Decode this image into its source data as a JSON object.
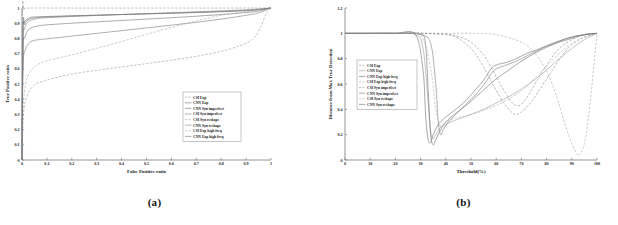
{
  "figure": {
    "subfigures": [
      {
        "caption": "(a)"
      },
      {
        "caption": "(b)"
      }
    ]
  },
  "chart_data": [
    {
      "type": "line",
      "title": "",
      "caption": "(a)",
      "xlabel": "False Positive ratio",
      "ylabel": "True Positive ratio",
      "xlim": [
        0,
        1
      ],
      "ylim": [
        0,
        1
      ],
      "xticks": [
        "0",
        "0.1",
        "0.2",
        "0.3",
        "0.4",
        "0.5",
        "0.6",
        "0.7",
        "0.8",
        "0.9",
        "1"
      ],
      "yticks": [
        "0",
        "0.1",
        "0.2",
        "0.3",
        "0.4",
        "0.5",
        "0.6",
        "0.7",
        "0.8",
        "0.9",
        "1"
      ],
      "grid": false,
      "legend_position": "lower-right",
      "series": [
        {
          "name": "CSI Exp",
          "style": "dashed",
          "color": "#8d8d8d",
          "x": [
            0,
            0.002,
            0.006,
            0.012,
            0.02,
            0.05,
            0.1,
            0.2,
            0.3,
            0.4,
            0.5,
            0.6,
            0.7,
            0.8,
            0.9,
            0.95,
            1
          ],
          "y": [
            0,
            0.97,
            0.992,
            0.997,
            0.999,
            1,
            1,
            1,
            1,
            1,
            1,
            1,
            1,
            1,
            1,
            1,
            1
          ]
        },
        {
          "name": "CNN Exp",
          "style": "solid",
          "color": "#6f6f6f",
          "x": [
            0,
            0.004,
            0.01,
            0.02,
            0.035,
            0.05,
            0.1,
            0.2,
            0.3,
            0.4,
            0.5,
            0.6,
            0.7,
            0.8,
            0.9,
            0.95,
            1
          ],
          "y": [
            0,
            0.86,
            0.905,
            0.925,
            0.938,
            0.941,
            0.944,
            0.949,
            0.953,
            0.957,
            0.961,
            0.965,
            0.97,
            0.975,
            0.982,
            0.988,
            1
          ]
        },
        {
          "name": "CNN Syn imperfect",
          "style": "solid",
          "color": "#777777",
          "x": [
            0,
            0.004,
            0.012,
            0.025,
            0.04,
            0.06,
            0.1,
            0.2,
            0.3,
            0.4,
            0.5,
            0.6,
            0.7,
            0.8,
            0.9,
            0.95,
            1
          ],
          "y": [
            0,
            0.71,
            0.81,
            0.855,
            0.872,
            0.881,
            0.889,
            0.9,
            0.909,
            0.918,
            0.927,
            0.936,
            0.946,
            0.957,
            0.97,
            0.98,
            1
          ]
        },
        {
          "name": "CSI Syn imperfect",
          "style": "solid",
          "color": "#7d7d7d",
          "x": [
            0,
            0.004,
            0.012,
            0.03,
            0.05,
            0.07,
            0.1,
            0.2,
            0.3,
            0.4,
            0.5,
            0.6,
            0.7,
            0.8,
            0.9,
            0.95,
            1
          ],
          "y": [
            0,
            0.6,
            0.72,
            0.772,
            0.787,
            0.792,
            0.797,
            0.815,
            0.833,
            0.851,
            0.869,
            0.887,
            0.906,
            0.927,
            0.952,
            0.968,
            1
          ]
        },
        {
          "name": "CSI Syn reshape",
          "style": "dashed",
          "color": "#a5a5a5",
          "x": [
            0,
            0.005,
            0.015,
            0.03,
            0.06,
            0.1,
            0.15,
            0.2,
            0.3,
            0.4,
            0.5,
            0.6,
            0.7,
            0.8,
            0.88,
            0.93,
            0.96,
            1
          ],
          "y": [
            0,
            0.35,
            0.5,
            0.575,
            0.625,
            0.652,
            0.672,
            0.692,
            0.735,
            0.78,
            0.827,
            0.872,
            0.915,
            0.952,
            0.972,
            0.982,
            0.988,
            1
          ]
        },
        {
          "name": "CNN Syn reshape",
          "style": "solid",
          "color": "#8a8a8a",
          "x": [
            0,
            0.004,
            0.01,
            0.02,
            0.04,
            0.07,
            0.1,
            0.2,
            0.3,
            0.4,
            0.5,
            0.6,
            0.7,
            0.8,
            0.9,
            0.95,
            1
          ],
          "y": [
            0,
            0.78,
            0.86,
            0.9,
            0.922,
            0.932,
            0.936,
            0.944,
            0.951,
            0.957,
            0.963,
            0.969,
            0.975,
            0.981,
            0.988,
            0.993,
            1
          ]
        },
        {
          "name": "CSI Exp high freq",
          "style": "dashed",
          "color": "#9a9a9a",
          "x": [
            0,
            0.006,
            0.02,
            0.05,
            0.09,
            0.12,
            0.2,
            0.3,
            0.4,
            0.5,
            0.6,
            0.7,
            0.8,
            0.88,
            0.93,
            0.96,
            0.98,
            1
          ],
          "y": [
            0,
            0.3,
            0.42,
            0.495,
            0.52,
            0.535,
            0.565,
            0.59,
            0.612,
            0.634,
            0.657,
            0.682,
            0.715,
            0.755,
            0.8,
            0.88,
            0.96,
            1
          ]
        },
        {
          "name": "CNN Exp high freq",
          "style": "solid",
          "color": "#757575",
          "x": [
            0,
            0.004,
            0.01,
            0.02,
            0.035,
            0.06,
            0.1,
            0.2,
            0.3,
            0.4,
            0.5,
            0.6,
            0.7,
            0.8,
            0.9,
            0.95,
            1
          ],
          "y": [
            0,
            0.83,
            0.89,
            0.915,
            0.93,
            0.937,
            0.941,
            0.947,
            0.952,
            0.957,
            0.962,
            0.967,
            0.972,
            0.978,
            0.985,
            0.991,
            1
          ]
        }
      ]
    },
    {
      "type": "line",
      "title": "",
      "caption": "(b)",
      "xlabel": "Threshold(%)",
      "ylabel": "Distance from Max True Detection",
      "xlim": [
        0,
        100
      ],
      "ylim": [
        0,
        1.2
      ],
      "xticks": [
        "0",
        "10",
        "20",
        "30",
        "40",
        "50",
        "60",
        "70",
        "80",
        "90",
        "100"
      ],
      "yticks": [
        "0",
        "0.2",
        "0.4",
        "0.6",
        "0.8",
        "1",
        "1.2"
      ],
      "grid": false,
      "legend_position": "middle-left",
      "series": [
        {
          "name": "CSI Exp",
          "style": "dashed",
          "color": "#8d8d8d",
          "x": [
            0,
            10,
            20,
            30,
            40,
            45,
            50,
            55,
            58,
            61,
            64,
            66,
            68,
            70,
            73,
            76,
            80,
            85,
            90,
            95,
            100
          ],
          "y": [
            1,
            1,
            1,
            1,
            0.995,
            0.975,
            0.93,
            0.83,
            0.73,
            0.62,
            0.52,
            0.46,
            0.43,
            0.44,
            0.52,
            0.62,
            0.75,
            0.88,
            0.95,
            0.99,
            1
          ]
        },
        {
          "name": "CNN Exp",
          "style": "solid",
          "color": "#9c9c9c",
          "x": [
            0,
            10,
            20,
            28,
            31,
            33,
            34,
            35,
            36,
            38,
            42,
            46,
            50,
            55,
            60,
            65,
            70,
            75,
            80,
            85,
            90,
            95,
            100
          ],
          "y": [
            1,
            1,
            1,
            0.99,
            0.88,
            0.45,
            0.22,
            0.17,
            0.2,
            0.26,
            0.3,
            0.33,
            0.36,
            0.4,
            0.45,
            0.5,
            0.56,
            0.63,
            0.71,
            0.8,
            0.88,
            0.95,
            1
          ]
        },
        {
          "name": "CNN Exp high freq",
          "style": "solid",
          "color": "#6f6f6f",
          "x": [
            0,
            10,
            20,
            30,
            32,
            33,
            34,
            35,
            36,
            38,
            40,
            44,
            48,
            52,
            56,
            60,
            65,
            70,
            75,
            80,
            85,
            90,
            95,
            100
          ],
          "y": [
            1,
            1,
            1,
            0.995,
            0.9,
            0.55,
            0.2,
            0.12,
            0.16,
            0.24,
            0.3,
            0.37,
            0.43,
            0.5,
            0.57,
            0.64,
            0.71,
            0.78,
            0.84,
            0.89,
            0.93,
            0.96,
            0.99,
            1
          ]
        },
        {
          "name": "CSI Exp high freq",
          "style": "dashed",
          "color": "#a8a8a8",
          "x": [
            0,
            10,
            20,
            30,
            40,
            50,
            60,
            70,
            75,
            80,
            84,
            87,
            90,
            92,
            93,
            95,
            97,
            99,
            100
          ],
          "y": [
            1,
            1,
            1,
            1,
            1,
            1,
            0.99,
            0.93,
            0.85,
            0.7,
            0.5,
            0.3,
            0.13,
            0.05,
            0.04,
            0.13,
            0.4,
            0.8,
            1
          ]
        },
        {
          "name": "CSI Syn imperfect",
          "style": "dashed",
          "color": "#8a8a8a",
          "x": [
            0,
            10,
            20,
            30,
            40,
            45,
            50,
            53,
            56,
            58,
            60,
            63,
            66,
            68,
            70,
            74,
            78,
            82,
            86,
            90,
            95,
            100
          ],
          "y": [
            1,
            1,
            1,
            1,
            0.99,
            0.96,
            0.88,
            0.8,
            0.7,
            0.62,
            0.55,
            0.45,
            0.38,
            0.36,
            0.38,
            0.46,
            0.58,
            0.7,
            0.82,
            0.91,
            0.97,
            1
          ]
        },
        {
          "name": "CNN Syn imperfect",
          "style": "solid",
          "color": "#818181",
          "x": [
            0,
            10,
            20,
            30,
            34,
            36,
            37,
            38,
            39,
            41,
            44,
            48,
            52,
            56,
            58,
            60,
            64,
            68,
            72,
            76,
            80,
            85,
            90,
            95,
            100
          ],
          "y": [
            1,
            1,
            1,
            0.99,
            0.92,
            0.6,
            0.3,
            0.2,
            0.24,
            0.3,
            0.36,
            0.44,
            0.52,
            0.62,
            0.68,
            0.72,
            0.75,
            0.78,
            0.82,
            0.86,
            0.9,
            0.94,
            0.97,
            0.99,
            1
          ]
        },
        {
          "name": "CSI Syn reshape",
          "style": "dashed",
          "color": "#b0b0b0",
          "x": [
            0,
            10,
            20,
            30,
            34,
            36,
            38,
            40,
            44,
            48,
            52,
            56,
            60,
            64,
            68,
            72,
            76,
            80,
            85,
            90,
            95,
            100
          ],
          "y": [
            1,
            1,
            1,
            0.98,
            0.72,
            0.4,
            0.26,
            0.3,
            0.33,
            0.35,
            0.37,
            0.4,
            0.43,
            0.47,
            0.52,
            0.58,
            0.66,
            0.74,
            0.84,
            0.92,
            0.97,
            1
          ]
        },
        {
          "name": "CNN Syn reshape",
          "style": "solid",
          "color": "#757575",
          "x": [
            0,
            10,
            20,
            28,
            31,
            32,
            33,
            34,
            35,
            37,
            40,
            44,
            48,
            52,
            55,
            58,
            60,
            64,
            68,
            72,
            76,
            80,
            84,
            88,
            92,
            96,
            100
          ],
          "y": [
            1,
            1,
            1,
            0.99,
            0.7,
            0.35,
            0.16,
            0.14,
            0.2,
            0.28,
            0.34,
            0.4,
            0.47,
            0.56,
            0.63,
            0.72,
            0.75,
            0.77,
            0.8,
            0.84,
            0.87,
            0.9,
            0.93,
            0.96,
            0.98,
            0.99,
            1
          ]
        }
      ]
    }
  ]
}
